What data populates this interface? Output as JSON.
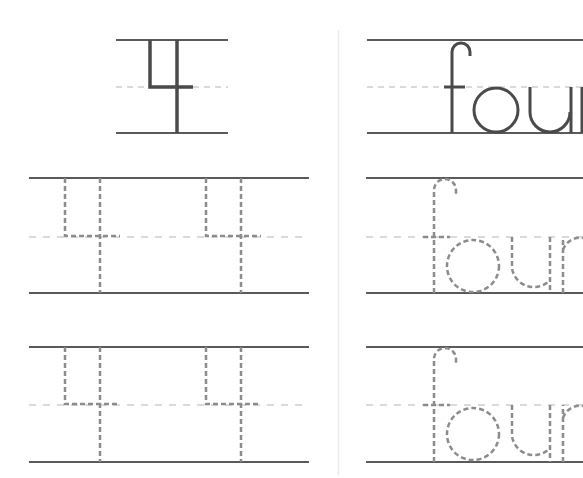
{
  "worksheet": {
    "numeral": "4",
    "word": "four",
    "colors": {
      "line": "#5a5a5a",
      "dashed_guide": "#b4b4b4",
      "glyph": "#4a4a4a",
      "trace": "#8c8c8c",
      "divider": "#ececec"
    },
    "sections": [
      {
        "name": "model-numeral",
        "content": "4",
        "style": "solid"
      },
      {
        "name": "model-word",
        "content": "four",
        "style": "solid"
      },
      {
        "name": "trace-numeral-row-1",
        "content": [
          "4",
          "4"
        ],
        "style": "dashed"
      },
      {
        "name": "trace-word-row-1",
        "content": "four",
        "style": "dashed"
      },
      {
        "name": "trace-numeral-row-2",
        "content": [
          "4",
          "4"
        ],
        "style": "dashed"
      },
      {
        "name": "trace-word-row-2",
        "content": "four",
        "style": "dashed"
      }
    ]
  }
}
